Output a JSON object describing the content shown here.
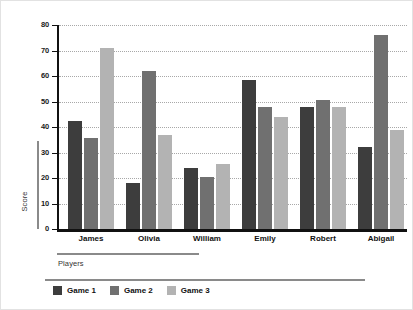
{
  "chart_data": {
    "type": "bar",
    "title": "",
    "subtitle": "",
    "xlabel": "Players",
    "ylabel": "Score",
    "categories": [
      "James",
      "Olivia",
      "William",
      "Emily",
      "Robert",
      "Abigail"
    ],
    "series": [
      {
        "name": "Game 1",
        "color": "#3d3d3d",
        "values": [
          42.5,
          18,
          24,
          58.5,
          48,
          32
        ]
      },
      {
        "name": "Game 2",
        "color": "#707070",
        "values": [
          35.5,
          62,
          20.5,
          48,
          50.5,
          76
        ]
      },
      {
        "name": "Game 3",
        "color": "#b3b3b3",
        "values": [
          71,
          37,
          25.5,
          44,
          48,
          39
        ]
      }
    ],
    "ylim": [
      0,
      80
    ],
    "yticks": [
      0,
      10,
      20,
      30,
      40,
      50,
      60,
      70,
      80
    ],
    "ytick_labels": [
      "0",
      "10",
      "20",
      "30",
      "40",
      "50",
      "60",
      "70",
      "80"
    ],
    "grid": true,
    "grid_style": "dotted",
    "grid_color": "#a8a8a8",
    "legend_position": "bottom-left",
    "background": "#ffffff",
    "axis_color": "#111111"
  },
  "legend": {
    "items": [
      {
        "label": "Game 1"
      },
      {
        "label": "Game 2"
      },
      {
        "label": "Game 3"
      }
    ]
  }
}
